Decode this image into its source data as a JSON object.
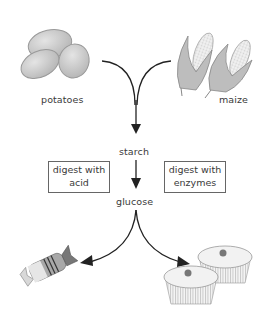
{
  "diagram": {
    "sources": [
      {
        "id": "potatoes",
        "label": "potatoes",
        "icon": "potatoes-icon"
      },
      {
        "id": "maize",
        "label": "maize",
        "icon": "maize-icon"
      }
    ],
    "intermediate": {
      "label": "starch"
    },
    "product": {
      "label": "glucose"
    },
    "methods": [
      {
        "line1": "digest with",
        "line2": "acid"
      },
      {
        "line1": "digest with",
        "line2": "enzymes"
      }
    ],
    "outputs": [
      {
        "id": "sweets",
        "icon": "wrapped-sweet-icon"
      },
      {
        "id": "cakes",
        "icon": "cupcakes-icon"
      }
    ],
    "colors": {
      "arrow": "#222222",
      "box_border": "#666666",
      "illustration_fill": "#c8c8c8",
      "illustration_stroke": "#888888"
    }
  }
}
